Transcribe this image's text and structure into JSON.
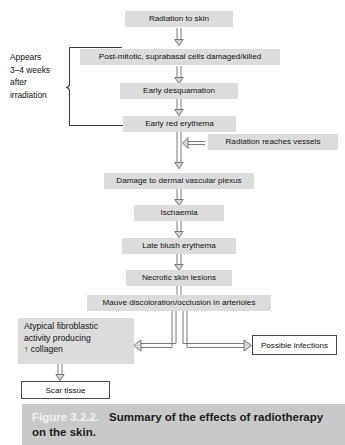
{
  "figure": {
    "caption_number": "Figure 3.2.2.",
    "caption_text_line1": "Summary of the effects of radiotherapy",
    "caption_text_line2": "on the skin.",
    "accent_shade": "#dcdcdc",
    "caption_bar_color": "#c9c9c9",
    "box_border_color": "#4a4a4a"
  },
  "side_bracket": {
    "label": "Appears\n3–4 weeks\nafter\nirradiation"
  },
  "nodes": {
    "radiation_to_skin": "Radiation to skin",
    "post_mitotic": "Post-mitotic, suprabasal cells damaged/killed",
    "early_desquamation": "Early desquamation",
    "early_red_erythema": "Early red erythema",
    "radiation_reaches_vessels": "Radiation reaches vessels",
    "damage_to_plexus": "Damage to dermal vascular plexus",
    "ischaemia": "Ischaemia",
    "late_blush_erythema": "Late blush erythema",
    "necrotic_skin_lesions": "Necrotic skin lesions",
    "mauve_discoloration": "Mauve discoloration/occlusion in arterioles",
    "atypical_fibroblastic_line1": "Atypical fibroblastic",
    "atypical_fibroblastic_line2": "activity producing",
    "atypical_fibroblastic_line3": "↑ collagen",
    "scar_tissue": "Scar tissue",
    "possible_infections": "Possible infections"
  },
  "flow": {
    "type": "flowchart",
    "orientation": "top-to-bottom",
    "edges": [
      {
        "from": "radiation_to_skin",
        "to": "post_mitotic",
        "style": "block-arrow-down"
      },
      {
        "from": "post_mitotic",
        "to": "early_desquamation",
        "style": "block-arrow-down"
      },
      {
        "from": "early_desquamation",
        "to": "early_red_erythema",
        "style": "block-arrow-down"
      },
      {
        "from": "early_red_erythema",
        "to": "damage_to_plexus",
        "style": "block-arrow-down"
      },
      {
        "from": "radiation_reaches_vessels",
        "to": "early_red_erythema_stem",
        "style": "arrow-left"
      },
      {
        "from": "damage_to_plexus",
        "to": "ischaemia",
        "style": "block-arrow-down"
      },
      {
        "from": "ischaemia",
        "to": "late_blush_erythema",
        "style": "block-arrow-down"
      },
      {
        "from": "late_blush_erythema",
        "to": "necrotic_skin_lesions",
        "style": "block-arrow-down"
      },
      {
        "from": "necrotic_skin_lesions",
        "to": "mauve_discoloration",
        "style": "block-arrow-down"
      },
      {
        "from": "mauve_discoloration",
        "to": "atypical_fibroblastic",
        "style": "elbow-arrow-left"
      },
      {
        "from": "mauve_discoloration",
        "to": "possible_infections",
        "style": "elbow-arrow-right"
      },
      {
        "from": "atypical_fibroblastic",
        "to": "scar_tissue",
        "style": "block-arrow-down"
      }
    ],
    "bracket_groups": [
      {
        "label": "Appears 3–4 weeks after irradiation",
        "members": [
          "post_mitotic",
          "early_desquamation",
          "early_red_erythema"
        ]
      }
    ]
  }
}
